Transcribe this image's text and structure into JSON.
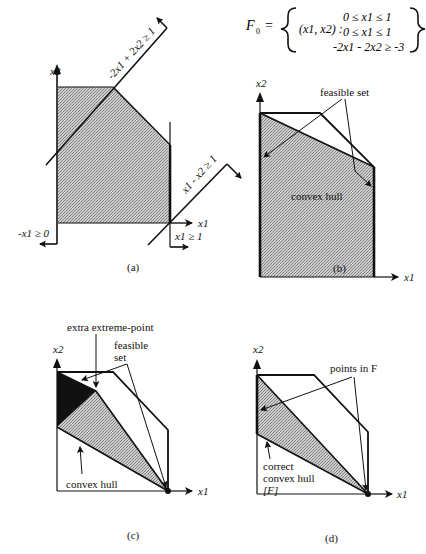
{
  "formula": {
    "lhs": "F",
    "lhs_sub": "0",
    "equals": "=",
    "var_tuple": "(x1, x2) :",
    "constraints": [
      "0 ≤ x1 ≤ 1",
      "0 ≤ x1 ≤ 1",
      "-2x1 - 2x2 ≥ -3"
    ]
  },
  "panels": {
    "a": {
      "caption": "(a)",
      "axis_x": "x1",
      "axis_y": "x2",
      "constraints": {
        "c1": "-2x1 + 2x2 ≥ 1",
        "c2": "x1 - x2 ≥ 1",
        "c3": "-x1 ≥ 0",
        "c4": "x1 ≥ 1"
      }
    },
    "b": {
      "caption": "(b)",
      "axis_x": "x1",
      "axis_y": "x2",
      "feasible_label": "feasible set",
      "hull_label": "convex hull"
    },
    "c": {
      "caption": "(c)",
      "axis_x": "x1",
      "axis_y": "x2",
      "extreme_label": "extra extreme-point",
      "feasible_label_1": "feasible",
      "feasible_label_2": "set",
      "hull_label": "convex hull"
    },
    "d": {
      "caption": "(d)",
      "axis_x": "x1",
      "axis_y": "x2",
      "points_label": "points in F",
      "hull_label_1": "correct",
      "hull_label_2": "convex hull",
      "hull_label_3": "[F]"
    }
  },
  "colors": {
    "stroke": "#111111",
    "fill_gray": "#b8b8b8",
    "fill_dark": "#111111"
  }
}
